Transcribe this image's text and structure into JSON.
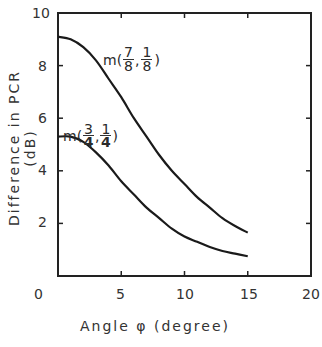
{
  "chart_data": {
    "type": "line",
    "title": "",
    "xlabel": "Angle φ (degree)",
    "ylabel": "Difference in PCR (dB)",
    "xlim": [
      0,
      20
    ],
    "ylim": [
      0,
      10
    ],
    "x_ticks": [
      "0",
      "5",
      "10",
      "15",
      "20"
    ],
    "y_ticks": [
      "2",
      "4",
      "6",
      "8",
      "10"
    ],
    "grid": false,
    "legend": "inline annotations",
    "series": [
      {
        "name": "m(7/8, 1/8)",
        "x": [
          0,
          1,
          2,
          3,
          4,
          5,
          6,
          7,
          8,
          9,
          10,
          11,
          12,
          13,
          14,
          15
        ],
        "values": [
          9.1,
          9.0,
          8.7,
          8.2,
          7.5,
          6.8,
          6.0,
          5.3,
          4.6,
          4.0,
          3.5,
          3.0,
          2.6,
          2.2,
          1.9,
          1.65
        ]
      },
      {
        "name": "m(3/4, 1/4)",
        "x": [
          0,
          1,
          2,
          3,
          4,
          5,
          6,
          7,
          8,
          9,
          10,
          11,
          12,
          13,
          14,
          15
        ],
        "values": [
          5.3,
          5.3,
          5.1,
          4.7,
          4.2,
          3.6,
          3.1,
          2.6,
          2.2,
          1.8,
          1.5,
          1.3,
          1.1,
          0.95,
          0.85,
          0.75
        ]
      }
    ]
  },
  "labels": {
    "xlabel": "Angle  φ  (degree)",
    "ylabel": "Difference in PCR (dB)",
    "x_ticks": [
      "0",
      "5",
      "10",
      "15",
      "20"
    ],
    "y_ticks": [
      "10",
      "8",
      "6",
      "4",
      "2"
    ],
    "series1_label": "m(",
    "series1_num1": "7",
    "series1_den1": "8",
    "series1_num2": "1",
    "series1_den2": "8",
    "series2_label": "m(",
    "series2_num1": "3",
    "series2_den1": "4",
    "series2_num2": "1",
    "series2_den2": "4"
  }
}
